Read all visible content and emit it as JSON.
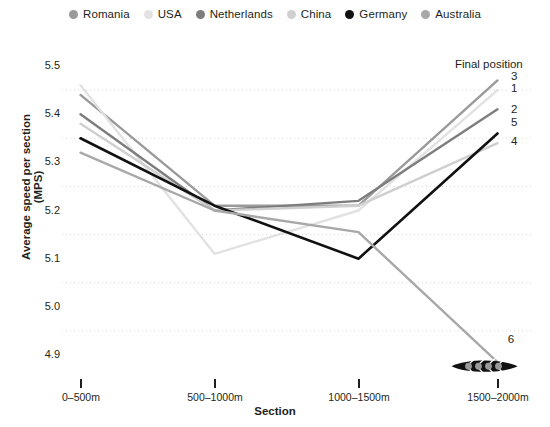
{
  "chart_data": {
    "type": "line",
    "title": "",
    "xlabel": "Section",
    "ylabel": "Average speed per section (MPS)",
    "categories": [
      "0–500m",
      "500–1000m",
      "1000–1500m",
      "1500–2000m"
    ],
    "ylim": [
      4.9,
      5.5
    ],
    "yticks": [
      "5.5",
      "5.4",
      "5.3",
      "5.2",
      "5.1",
      "5.0",
      "4.9"
    ],
    "grid": "horizontal-dotted",
    "legend_position": "top-center",
    "annotation_header": "Final position",
    "series": [
      {
        "name": "Romania",
        "color": "#9a9a9a",
        "values": [
          5.44,
          5.21,
          5.21,
          5.47
        ],
        "final_position": "3"
      },
      {
        "name": "USA",
        "color": "#e2e2e2",
        "values": [
          5.46,
          5.11,
          5.2,
          5.45
        ],
        "final_position": "1"
      },
      {
        "name": "Netherlands",
        "color": "#7d7d7d",
        "values": [
          5.4,
          5.2,
          5.22,
          5.41
        ],
        "final_position": "2"
      },
      {
        "name": "China",
        "color": "#cfcfcf",
        "values": [
          5.38,
          5.2,
          5.21,
          5.34
        ],
        "final_position": "4"
      },
      {
        "name": "Germany",
        "color": "#111111",
        "values": [
          5.35,
          5.21,
          5.1,
          5.36
        ],
        "final_position": "5"
      },
      {
        "name": "Australia",
        "color": "#a8a8a8",
        "values": [
          5.32,
          5.2,
          5.155,
          4.885
        ],
        "final_position": "6"
      }
    ],
    "end_marker": {
      "series": "Australia",
      "icon": "rowing-boat-icon",
      "label": "6"
    }
  },
  "legend": {
    "items": [
      {
        "label": "Romania",
        "color": "#9a9a9a"
      },
      {
        "label": "USA",
        "color": "#e2e2e2"
      },
      {
        "label": "Netherlands",
        "color": "#7d7d7d"
      },
      {
        "label": "China",
        "color": "#cfcfcf"
      },
      {
        "label": "Germany",
        "color": "#111111"
      },
      {
        "label": "Australia",
        "color": "#a8a8a8"
      }
    ]
  }
}
